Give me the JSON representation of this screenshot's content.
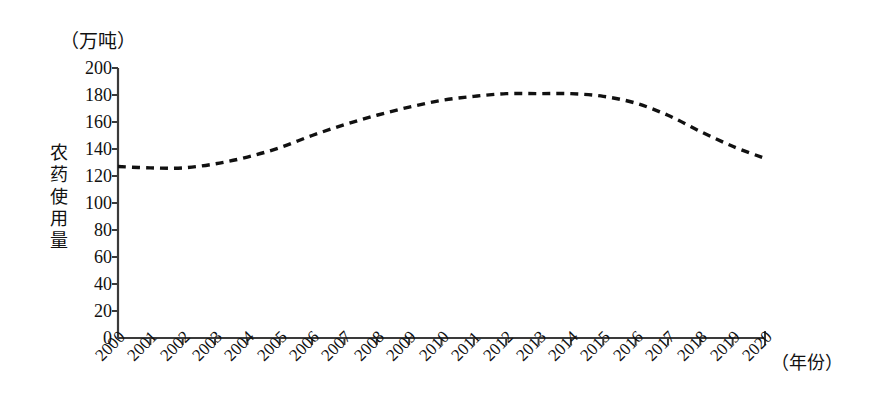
{
  "chart_data": {
    "type": "line",
    "title": "",
    "subtitle": "",
    "unit_label": "（万吨）",
    "ylabel": "农药使用量",
    "xlabel": "（年份）",
    "xlim": [
      2000,
      2020
    ],
    "ylim": [
      0,
      200
    ],
    "grid": false,
    "legend": null,
    "line_style": "dashed",
    "line_color": "#111111",
    "x": [
      2000,
      2001,
      2002,
      2003,
      2004,
      2005,
      2006,
      2007,
      2008,
      2009,
      2010,
      2011,
      2012,
      2013,
      2014,
      2015,
      2016,
      2017,
      2018,
      2019,
      2020
    ],
    "categories": [
      "2000",
      "2001",
      "2002",
      "2003",
      "2004",
      "2005",
      "2006",
      "2007",
      "2008",
      "2009",
      "2010",
      "2011",
      "2012",
      "2013",
      "2014",
      "2015",
      "2016",
      "2017",
      "2018",
      "2019",
      "2020"
    ],
    "values": [
      127,
      126,
      126,
      129,
      134,
      141,
      150,
      158,
      165,
      171,
      176,
      179,
      181,
      181,
      181,
      179,
      174,
      165,
      153,
      142,
      133
    ],
    "yticks": [
      0,
      20,
      40,
      60,
      80,
      100,
      120,
      140,
      160,
      180,
      200
    ],
    "ytick_labels": [
      "0",
      "20",
      "40",
      "60",
      "80",
      "100",
      "120",
      "140",
      "160",
      "180",
      "200"
    ],
    "xtick_labels": [
      "2000",
      "2001",
      "2002",
      "2003",
      "2004",
      "2005",
      "2006",
      "2007",
      "2008",
      "2009",
      "2010",
      "2011",
      "2012",
      "2013",
      "2014",
      "2015",
      "2016",
      "2017",
      "2018",
      "2019",
      "2020"
    ],
    "axis_color": "#3a3a3a"
  }
}
